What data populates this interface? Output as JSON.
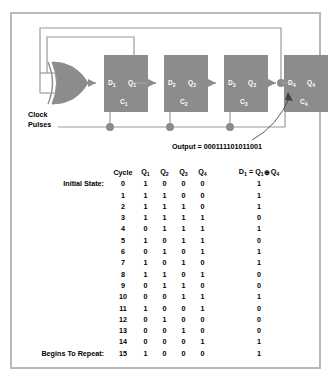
{
  "figure": {
    "border_color": "#b9b9b9",
    "block_fill": "#8c8c8c",
    "wire_color": "#9a9a9a"
  },
  "circuit": {
    "clock_label_line1": "Clock",
    "clock_label_line2": "Pulses",
    "output_label": "Output = 000111101011001",
    "output_bits": "000111101011001",
    "gate": {
      "type": "xor-gate",
      "name": "XOR"
    },
    "flipflops": [
      {
        "d": "D",
        "d_sub": "1",
        "q": "Q",
        "q_sub": "1",
        "c": "C",
        "c_sub": "1"
      },
      {
        "d": "D",
        "d_sub": "2",
        "q": "Q",
        "q_sub": "2",
        "c": "C",
        "c_sub": "2"
      },
      {
        "d": "D",
        "d_sub": "3",
        "q": "Q",
        "q_sub": "3",
        "c": "C",
        "c_sub": "3"
      },
      {
        "d": "D",
        "d_sub": "4",
        "q": "Q",
        "q_sub": "4",
        "c": "C",
        "c_sub": "4"
      }
    ]
  },
  "table": {
    "headers": {
      "note": "",
      "cycle": "Cycle",
      "q1": "Q",
      "q1_sub": "1",
      "q2": "Q",
      "q2_sub": "2",
      "q3": "Q",
      "q3_sub": "3",
      "q4": "Q",
      "q4_sub": "4",
      "d_expr_lead": "D",
      "d_expr_lead_sub": "1",
      "d_expr_eq": " = ",
      "d_expr_a": "Q",
      "d_expr_a_sub": "1",
      "d_expr_op": "⊕",
      "d_expr_b": "Q",
      "d_expr_b_sub": "4"
    },
    "rows": [
      {
        "note": "Initial State:",
        "cycle": "0",
        "q1": "1",
        "q2": "0",
        "q3": "0",
        "q4": "0",
        "d": "1"
      },
      {
        "note": "",
        "cycle": "1",
        "q1": "1",
        "q2": "1",
        "q3": "0",
        "q4": "0",
        "d": "1"
      },
      {
        "note": "",
        "cycle": "2",
        "q1": "1",
        "q2": "1",
        "q3": "1",
        "q4": "0",
        "d": "1"
      },
      {
        "note": "",
        "cycle": "3",
        "q1": "1",
        "q2": "1",
        "q3": "1",
        "q4": "1",
        "d": "0"
      },
      {
        "note": "",
        "cycle": "4",
        "q1": "0",
        "q2": "1",
        "q3": "1",
        "q4": "1",
        "d": "1"
      },
      {
        "note": "",
        "cycle": "5",
        "q1": "1",
        "q2": "0",
        "q3": "1",
        "q4": "1",
        "d": "0"
      },
      {
        "note": "",
        "cycle": "6",
        "q1": "0",
        "q2": "1",
        "q3": "0",
        "q4": "1",
        "d": "1"
      },
      {
        "note": "",
        "cycle": "7",
        "q1": "1",
        "q2": "0",
        "q3": "1",
        "q4": "0",
        "d": "1"
      },
      {
        "note": "",
        "cycle": "8",
        "q1": "1",
        "q2": "1",
        "q3": "0",
        "q4": "1",
        "d": "0"
      },
      {
        "note": "",
        "cycle": "9",
        "q1": "0",
        "q2": "1",
        "q3": "1",
        "q4": "0",
        "d": "0"
      },
      {
        "note": "",
        "cycle": "10",
        "q1": "0",
        "q2": "0",
        "q3": "1",
        "q4": "1",
        "d": "1"
      },
      {
        "note": "",
        "cycle": "11",
        "q1": "1",
        "q2": "0",
        "q3": "0",
        "q4": "1",
        "d": "0"
      },
      {
        "note": "",
        "cycle": "12",
        "q1": "0",
        "q2": "1",
        "q3": "0",
        "q4": "0",
        "d": "0"
      },
      {
        "note": "",
        "cycle": "13",
        "q1": "0",
        "q2": "0",
        "q3": "1",
        "q4": "0",
        "d": "0"
      },
      {
        "note": "",
        "cycle": "14",
        "q1": "0",
        "q2": "0",
        "q3": "0",
        "q4": "1",
        "d": "1"
      },
      {
        "note": "Begins To Repeat:",
        "cycle": "15",
        "q1": "1",
        "q2": "0",
        "q3": "0",
        "q4": "0",
        "d": "1"
      }
    ]
  }
}
